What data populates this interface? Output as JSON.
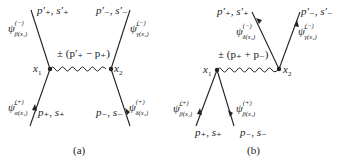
{
  "diagrams": [
    {
      "caption": "(a)",
      "vertex_labels": [
        "x1",
        "x2"
      ],
      "x1": "x",
      "x1_sub": "1",
      "x2": "x",
      "x2_sub": "2",
      "exchange": "± (p′₊ − p₊)",
      "top_left": "p′₊, s′₊",
      "top_right": "p′₋, s′₋",
      "bottom_left": "p₊, s₊",
      "bottom_right": "p₋, s₋",
      "psi_top_left": {
        "base": "ψ",
        "sup": "(−)",
        "sub": "β(x₁)"
      },
      "psi_top_right": {
        "base": "ψ̄",
        "sup": "(−)",
        "sub": "γ(x₂)"
      },
      "psi_bottom_left": {
        "base": "ψ̄",
        "sup": "(+)",
        "sub": "α(x₁)"
      },
      "psi_bottom_right": {
        "base": "ψ",
        "sup": "(+)",
        "sub": "δ(x₂)"
      }
    },
    {
      "caption": "(b)",
      "x1": "x",
      "x1_sub": "1",
      "x2": "x",
      "x2_sub": "2",
      "exchange": "± (p₊ + p₋)",
      "top_left": "p′₊, s′₊",
      "top_right": "p′₋, s′₋",
      "bottom_left": "p₊, s₊",
      "bottom_right": "p₋, s₋",
      "psi_top_left": {
        "base": "ψ",
        "sup": "(−)",
        "sub": "δ(x₂)"
      },
      "psi_top_right": {
        "base": "ψ̄",
        "sup": "(−)",
        "sub": "γ(x₂)"
      },
      "psi_bottom_left": {
        "base": "ψ̄",
        "sup": "(+)",
        "sub": "β(x₁)"
      },
      "psi_bottom_right": {
        "base": "ψ",
        "sup": "(+)",
        "sub": "β(x₁)"
      }
    }
  ]
}
